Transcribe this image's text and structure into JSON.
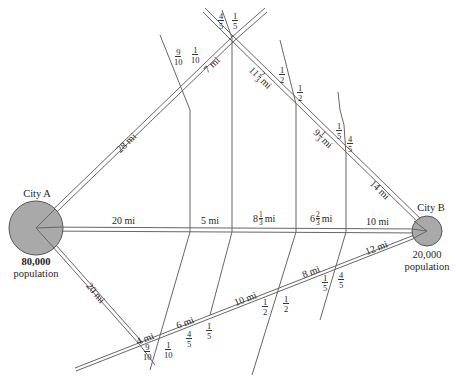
{
  "cities": {
    "a": {
      "name": "City A",
      "population": "80,000",
      "population_label": "population"
    },
    "b": {
      "name": "City B",
      "population": "20,000",
      "population_label": "population"
    }
  },
  "roads": {
    "main": [
      "20 mi",
      "5 mi",
      "10 mi"
    ],
    "main_mixed": [
      {
        "whole": "8",
        "num": "1",
        "den": "3",
        "unit": "mi"
      },
      {
        "whole": "6",
        "num": "2",
        "den": "3",
        "unit": "mi"
      }
    ],
    "upper": [
      "28 mi",
      "7 mi",
      "14 mi"
    ],
    "upper_mixed": [
      {
        "whole": "11",
        "num": "2",
        "den": "3",
        "unit": "mi"
      },
      {
        "whole": "9",
        "num": "1",
        "den": "3",
        "unit": "mi"
      }
    ],
    "lower_a": "20 mi",
    "lower": [
      "4 mi",
      "6 mi",
      "10 mi",
      "8 mi",
      "12 mi"
    ]
  },
  "fractions": {
    "top_left_9_10": {
      "num": "9",
      "den": "10"
    },
    "top_left_1_10": {
      "num": "1",
      "den": "10"
    },
    "apex_4_5": {
      "num": "4",
      "den": "5"
    },
    "apex_1_5": {
      "num": "1",
      "den": "5"
    },
    "upper_1_2_a": {
      "num": "1",
      "den": "2"
    },
    "upper_1_2_b": {
      "num": "1",
      "den": "2"
    },
    "upper_1_5": {
      "num": "1",
      "den": "5"
    },
    "upper_4_5": {
      "num": "4",
      "den": "5"
    },
    "low_9_10": {
      "num": "9",
      "den": "10"
    },
    "low_1_10": {
      "num": "1",
      "den": "10"
    },
    "low_4_5": {
      "num": "4",
      "den": "5"
    },
    "low_1_5": {
      "num": "1",
      "den": "5"
    },
    "low_1_2_a": {
      "num": "1",
      "den": "2"
    },
    "low_1_2_b": {
      "num": "1",
      "den": "2"
    },
    "low_1_5_b": {
      "num": "1",
      "den": "5"
    },
    "low_4_5_b": {
      "num": "4",
      "den": "5"
    }
  },
  "colors": {
    "city_fill": "#a9a9a9",
    "line": "#555555"
  }
}
